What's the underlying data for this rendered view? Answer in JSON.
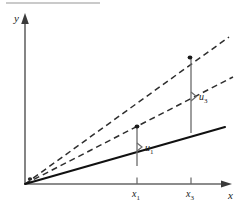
{
  "figure": {
    "top_rule": {
      "present": true,
      "color": "#b9b9b9"
    },
    "colors": {
      "ink": "#1a1a1a",
      "line_solid": "#111111",
      "line_dashed": "#333333",
      "axis": "#555555",
      "brace": "#555555",
      "top_rule": "#b9b9b9"
    },
    "axes": {
      "y_label": "y",
      "x_label": "x",
      "origin_label": "",
      "y_axis": {
        "x": 25,
        "y_top": 15,
        "y_bottom": 184
      },
      "x_axis": {
        "y": 184,
        "x_left": 25,
        "x_right": 232
      }
    },
    "ticks": [
      {
        "name": "x1",
        "label": "x",
        "subscript": "1",
        "x": 137
      },
      {
        "name": "x3",
        "label": "x",
        "subscript": "3",
        "x": 191
      }
    ],
    "lines": [
      {
        "name": "fitted-regression-line",
        "style": "solid",
        "x1": 25,
        "y1": 184,
        "x2": 225,
        "y2": 127
      },
      {
        "name": "dashed-line-upper",
        "style": "dashed",
        "x1": 25,
        "y1": 184,
        "x2": 229,
        "y2": 37
      },
      {
        "name": "dashed-line-lower",
        "style": "dashed",
        "x1": 25,
        "y1": 184,
        "x2": 233,
        "y2": 77
      }
    ],
    "points": [
      {
        "name": "observation-point-1",
        "x": 137,
        "y": 127
      },
      {
        "name": "observation-point-3",
        "x": 190,
        "y": 58
      }
    ],
    "residuals": [
      {
        "name": "residual-u1",
        "label": "u",
        "subscript": "1",
        "x": 137,
        "y_top": 128,
        "y_bottom": 166,
        "label_x": 146,
        "label_y": 151
      },
      {
        "name": "residual-u3",
        "label": "u",
        "subscript": "3",
        "x": 191,
        "y_top": 59,
        "y_bottom": 133,
        "label_x": 200,
        "label_y": 101
      }
    ]
  }
}
